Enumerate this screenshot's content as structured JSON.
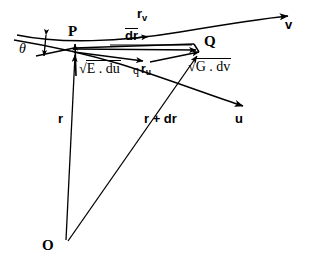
{
  "figure": {
    "kind": "differential-geometry-surface-patch",
    "background_color": "#ffffff",
    "ink_color": "#000000"
  },
  "points": {
    "origin_label": "O",
    "p_label": "P",
    "q_label": "Q"
  },
  "labels": {
    "theta": "θ",
    "r_v": "r",
    "r_v_sub": "v",
    "r_u": "r",
    "r_u_sub": "u",
    "dr": "dr",
    "r": "r",
    "r_plus_dr": "r + dr",
    "u_curve": "u",
    "v_curve": "v",
    "stray_mark": "q"
  },
  "first_fundamental_form": {
    "e_term_radical": "√",
    "e_term_body": "E . du",
    "g_term_radical": "√",
    "g_term_body": "G . dv"
  },
  "geometry": {
    "p": [
      74,
      48
    ],
    "q": [
      199,
      48
    ],
    "o": [
      65,
      243
    ],
    "v_curve_arrow_end": [
      293,
      16
    ],
    "u_curve_arrow_end": [
      249,
      108
    ]
  }
}
